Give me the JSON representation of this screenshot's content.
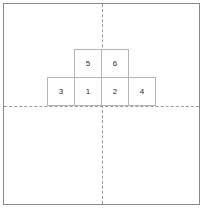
{
  "figure": {
    "background_color": "#ffffff",
    "frame_border_color": "#8a8a8a",
    "axis_color": "#9a9a9a",
    "cell_border_color": "#b5b5b5",
    "label_color": "#2b2b2b"
  },
  "axes": {
    "vertical": {
      "name": "vertical-axis",
      "style": "dashed",
      "x": 102
    },
    "horizontal": {
      "name": "horizontal-axis",
      "style": "dashed",
      "y": 106
    }
  },
  "chart_data": {
    "type": "table",
    "xlabel": "",
    "ylabel": "",
    "grid": true,
    "legend": "none",
    "rows": [
      {
        "row": "top",
        "cells": [
          {
            "label": "5",
            "col": 1
          },
          {
            "label": "6",
            "col": 2
          }
        ]
      },
      {
        "row": "bottom",
        "cells": [
          {
            "label": "3",
            "col": 0
          },
          {
            "label": "1",
            "col": 1
          },
          {
            "label": "2",
            "col": 2
          },
          {
            "label": "4",
            "col": 3
          }
        ]
      }
    ],
    "cells_flat": [
      "3",
      "1",
      "2",
      "4",
      "5",
      "6"
    ]
  }
}
